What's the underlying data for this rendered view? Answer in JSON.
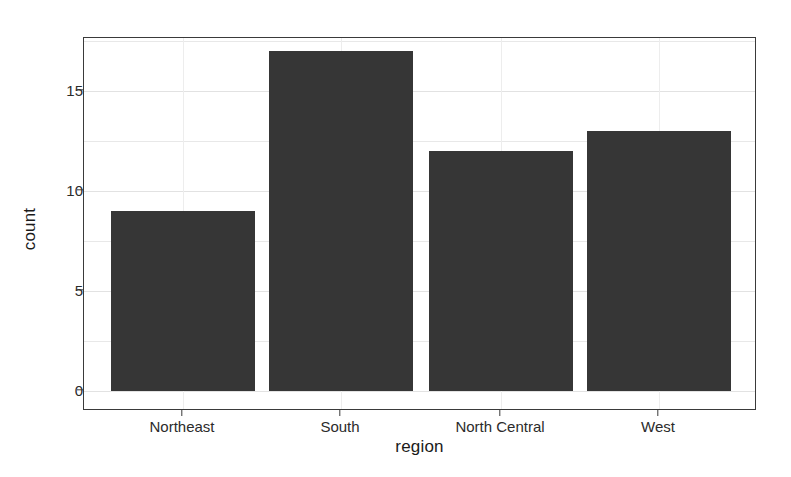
{
  "chart_data": {
    "type": "bar",
    "title": "",
    "subtitle": "",
    "xlabel": "region",
    "ylabel": "count",
    "categories": [
      "Northeast",
      "South",
      "North Central",
      "West"
    ],
    "values": [
      9,
      17,
      12,
      13
    ],
    "series": [
      {
        "name": "count",
        "values": [
          9,
          17,
          12,
          13
        ]
      }
    ],
    "ylim": [
      0,
      18.65
    ],
    "ytick_labels": [
      "0",
      "5",
      "10",
      "15"
    ],
    "ytick_values": [
      0,
      5,
      10,
      15
    ],
    "xtick_labels": [
      "Northeast",
      "South",
      "North Central",
      "West"
    ],
    "grid": true,
    "legend": "none",
    "bar_color": "#363636",
    "panel_background": "#ffffff",
    "grid_color": "#e8e8e8",
    "axis_color": "#3a3a3a"
  },
  "axes": {
    "y_title": "count",
    "x_title": "region"
  }
}
